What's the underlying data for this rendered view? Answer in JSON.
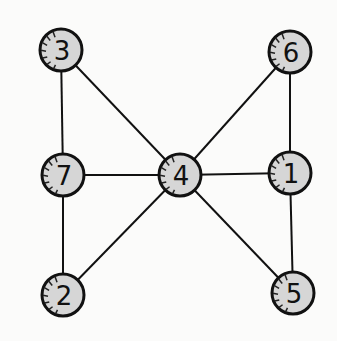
{
  "graph": {
    "nodes": [
      {
        "id": "3",
        "label": "3"
      },
      {
        "id": "6",
        "label": "6"
      },
      {
        "id": "7",
        "label": "7"
      },
      {
        "id": "4",
        "label": "4"
      },
      {
        "id": "1",
        "label": "1"
      },
      {
        "id": "2",
        "label": "2"
      },
      {
        "id": "5",
        "label": "5"
      }
    ],
    "edges": [
      [
        "3",
        "7"
      ],
      [
        "3",
        "4"
      ],
      [
        "7",
        "4"
      ],
      [
        "7",
        "2"
      ],
      [
        "2",
        "4"
      ],
      [
        "4",
        "6"
      ],
      [
        "4",
        "1"
      ],
      [
        "4",
        "5"
      ],
      [
        "6",
        "1"
      ],
      [
        "1",
        "5"
      ]
    ],
    "colors": {
      "node_fill": "#d6d6d6",
      "stroke": "#111111"
    }
  }
}
